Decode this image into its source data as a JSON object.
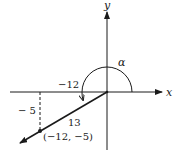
{
  "diagram": {
    "type": "reference-angle-coordinate-diagram",
    "axes": {
      "x_label": "x",
      "y_label": "y"
    },
    "angle": {
      "label": "α",
      "direction": "counterclockwise"
    },
    "point": {
      "label": "(−12, −5)",
      "x": -12,
      "y": -5
    },
    "segments": {
      "horizontal_label": "−12",
      "vertical_label": "− 5",
      "hypotenuse_label": "13"
    },
    "colors": {
      "ink": "#1a1a1a",
      "background": "#ffffff"
    }
  }
}
